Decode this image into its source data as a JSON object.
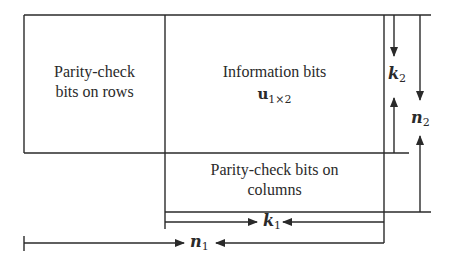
{
  "diagram": {
    "type": "product-code-layout",
    "blocks": {
      "parity_rows": {
        "line1": "Parity-check",
        "line2": "bits on rows"
      },
      "information": {
        "line1": "Information bits",
        "symbol": "u",
        "subscript": "1×2"
      },
      "parity_columns": {
        "line1": "Parity-check bits on",
        "line2": "columns"
      }
    },
    "dimensions": {
      "k2": {
        "symbol": "k",
        "subscript": "2"
      },
      "n2": {
        "symbol": "n",
        "subscript": "2"
      },
      "k1": {
        "symbol": "k",
        "subscript": "1"
      },
      "n1": {
        "symbol": "n",
        "subscript": "1"
      }
    },
    "colors": {
      "stroke": "#2a2a2a",
      "background": "#ffffff"
    }
  }
}
